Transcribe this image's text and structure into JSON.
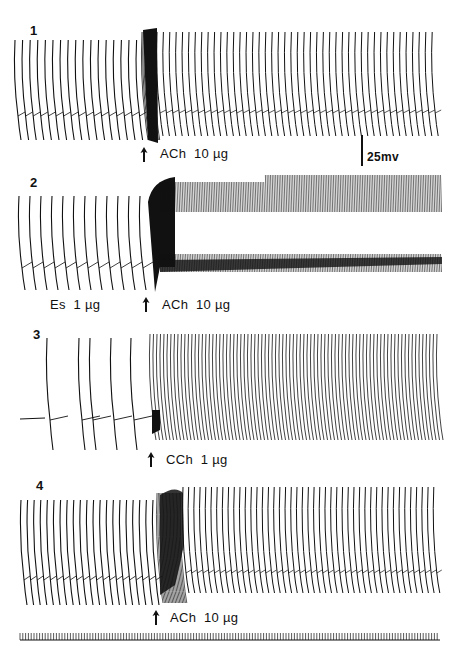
{
  "figure": {
    "panels": [
      {
        "num": "1",
        "drug_label": "ACh  10 µg",
        "pre_label": ""
      },
      {
        "num": "2",
        "drug_label": "ACh  10 µg",
        "pre_label": "Es  1 µg"
      },
      {
        "num": "3",
        "drug_label": "CCh  1 µg",
        "pre_label": ""
      },
      {
        "num": "4",
        "drug_label": "ACh  10 µg",
        "pre_label": ""
      }
    ],
    "scale_bar_label": "25mv",
    "arrow_icon": "↑"
  }
}
